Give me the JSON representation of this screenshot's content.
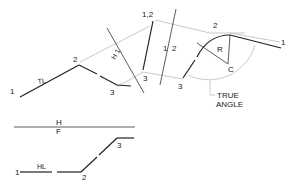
{
  "labels": {
    "top_1": "1",
    "top_2": "2",
    "top_3": "3",
    "tl": "TL",
    "h1_line": "H 1",
    "aux1_12": "1,2",
    "aux1_3": "3",
    "fold_12_a": "1",
    "fold_12_b": "2",
    "aux2_2": "2",
    "aux2_1": "1",
    "aux2_3": "3",
    "radius": "R",
    "center": "C",
    "true_angle_1": "TRUE",
    "true_angle_2": "ANGLE",
    "fold_h": "H",
    "fold_f": "F",
    "bot_1": "1",
    "hl": "HL",
    "bot_2": "2",
    "bot_3": "3"
  },
  "colors": {
    "line": "#222222",
    "projector": "#bbbbbb"
  }
}
